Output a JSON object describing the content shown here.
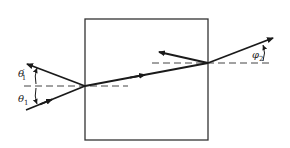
{
  "diagram": {
    "type": "optics-refraction-slab",
    "colors": {
      "line": "#1a1a1a",
      "box": "#333333",
      "dash": "#444444"
    },
    "labels": {
      "theta1_prime": {
        "sym": "θ",
        "prime": "′",
        "sub": "1"
      },
      "theta1": {
        "sym": "θ",
        "sub": "1"
      },
      "phi2": {
        "sym": "φ",
        "sub": "2"
      }
    }
  }
}
